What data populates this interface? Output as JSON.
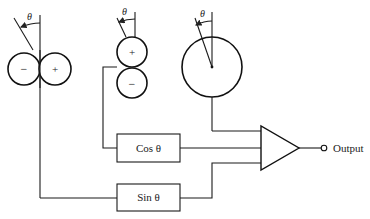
{
  "diagram": {
    "angle_symbol": "θ",
    "sensors": [
      {
        "name": "figure-eight-horizontal",
        "lobes": [
          "−",
          "+"
        ]
      },
      {
        "name": "figure-eight-vertical",
        "lobes": [
          "+",
          "−"
        ]
      },
      {
        "name": "omnidirectional",
        "lobes": []
      }
    ],
    "blocks": {
      "cos_label": "Cos θ",
      "sin_label": "Sin θ"
    },
    "output_label": "Output"
  }
}
